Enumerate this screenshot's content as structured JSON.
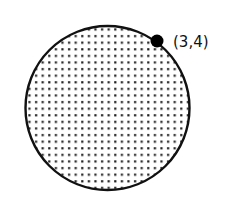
{
  "diagram": {
    "shape": "circle",
    "fill_pattern": "dotted",
    "colors": {
      "stroke": "#111111",
      "dot": "#222222",
      "background": "#ffffff"
    },
    "point": {
      "label": "(3,4)",
      "x": 3,
      "y": 4
    }
  }
}
